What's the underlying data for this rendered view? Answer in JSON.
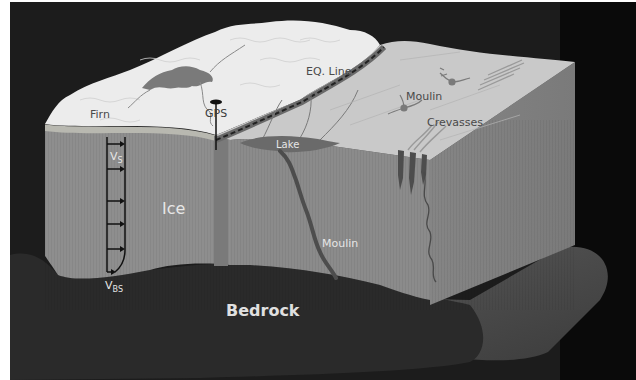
{
  "figure": {
    "type": "schematic block diagram",
    "colors": {
      "background": "#1c1c1c",
      "frame": "#ffffff",
      "firn_surface": "#ececec",
      "ablation_surface": "#c9c9c9",
      "ice_front_face": "#8e8e8e",
      "ice_side_face": "#7e7e7e",
      "firn_layer": "#b8b8b0",
      "lake": "#6a6a6a",
      "moulin_channel": "#4a4a4a",
      "bedrock": "#2a2a2a",
      "bedrock_ledge": "#4d4d4d",
      "eq_line": "#555555",
      "label_dark": "#4a4a4a",
      "label_light": "#e6e6e6"
    }
  },
  "labels": {
    "firn": "Firn",
    "gps": "GPS",
    "eq_line": "EQ. Line",
    "moulin_surface": "Moulin",
    "crevasses": "Crevasses",
    "lake": "Lake",
    "ice": "Ice",
    "moulin_deep": "Moulin",
    "bedrock": "Bedrock",
    "velocity_surface_main": "V",
    "velocity_surface_sub": "S",
    "velocity_basal_main": "V",
    "velocity_basal_sub": "BS"
  },
  "velocity_profile": {
    "arrow_count": 6,
    "description": "Vertical velocity profile: surface velocity Vs at top, basal sliding velocity Vbs at bed"
  }
}
